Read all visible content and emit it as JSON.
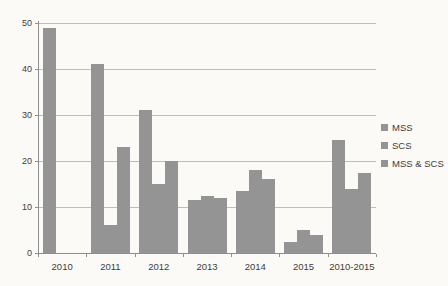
{
  "chart_data": {
    "type": "bar",
    "title": "",
    "xlabel": "",
    "ylabel": "",
    "categories": [
      "2010",
      "2011",
      "2012",
      "2013",
      "2014",
      "2015",
      "2010-2015"
    ],
    "series": [
      {
        "name": "MSS",
        "values": [
          49,
          41,
          31,
          11.5,
          13.5,
          2.5,
          24.5
        ]
      },
      {
        "name": "SCS",
        "values": [
          0,
          6,
          15,
          12.5,
          18,
          5,
          14
        ]
      },
      {
        "name": "MSS & SCS",
        "values": [
          0,
          23,
          20,
          12,
          16,
          4,
          17.5
        ]
      }
    ],
    "ylim": [
      0,
      50
    ],
    "ytick_step": 10,
    "grid": "horizontal",
    "legend_position": "right",
    "colors": {
      "bar": "#949494",
      "gridline": "#bdbdbd",
      "axis": "#8f8f8f",
      "text": "#3d3d3d",
      "background": "#fbfaf7"
    }
  }
}
